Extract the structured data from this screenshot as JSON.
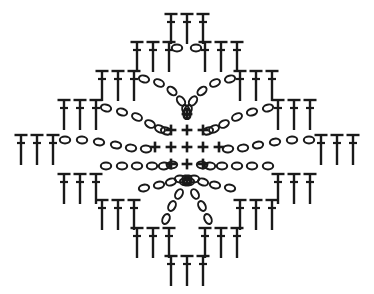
{
  "document": {
    "title": "Crochet Stitch Diagram",
    "kind": "crochet-pattern-chart",
    "background_color": "#ffffff",
    "ink_color": "#1a1a1a",
    "width": 374,
    "height": 294
  },
  "legend": {
    "symbols": [
      {
        "id": "dc",
        "glyph": "T",
        "name": "double-crochet-stitch",
        "description": "vertical stem with horizontal top bar and middle cross bar"
      },
      {
        "id": "ch",
        "glyph": "o",
        "name": "chain-stitch",
        "description": "small open oval"
      },
      {
        "id": "sc",
        "glyph": "+",
        "name": "single-crochet-stitch",
        "description": "plus / cross"
      }
    ]
  },
  "chart_data": {
    "type": "diagram",
    "symmetry": "8-way radial, mirrored horizontally and vertically",
    "center": {
      "x": 187,
      "y": 147
    },
    "counts": {
      "dc_total": 72,
      "ch_total": 78,
      "sc_total": 13
    },
    "sc_cluster": {
      "name": "center-single-crochet-cluster",
      "rows": [
        {
          "y": 114,
          "xs": [
            187
          ]
        },
        {
          "y": 130,
          "xs": [
            171,
            187,
            203
          ]
        },
        {
          "y": 147,
          "xs": [
            155,
            171,
            187,
            203,
            219
          ]
        },
        {
          "y": 164,
          "xs": [
            171,
            187,
            203
          ]
        },
        {
          "y": 180,
          "xs": [
            187
          ]
        }
      ]
    },
    "dc_groups": [
      {
        "name": "dc-top-center",
        "count": 3,
        "x": 187,
        "y": 14,
        "angle": 0,
        "spacing": 16
      },
      {
        "name": "dc-row2-left",
        "count": 3,
        "x": 153,
        "y": 42,
        "angle": 0,
        "spacing": 16
      },
      {
        "name": "dc-row2-right",
        "count": 3,
        "x": 221,
        "y": 42,
        "angle": 0,
        "spacing": 16
      },
      {
        "name": "dc-row3-left",
        "count": 3,
        "x": 118,
        "y": 71,
        "angle": 0,
        "spacing": 16
      },
      {
        "name": "dc-row3-right",
        "count": 3,
        "x": 256,
        "y": 71,
        "angle": 0,
        "spacing": 16
      },
      {
        "name": "dc-row4-left",
        "count": 3,
        "x": 80,
        "y": 100,
        "angle": 0,
        "spacing": 16
      },
      {
        "name": "dc-row4-right",
        "count": 3,
        "x": 294,
        "y": 100,
        "angle": 0,
        "spacing": 16
      },
      {
        "name": "dc-mid-left",
        "count": 3,
        "x": 37,
        "y": 135,
        "angle": 0,
        "spacing": 16
      },
      {
        "name": "dc-mid-right",
        "count": 3,
        "x": 337,
        "y": 135,
        "angle": 0,
        "spacing": 16
      },
      {
        "name": "dc-row6-left",
        "count": 3,
        "x": 80,
        "y": 174,
        "angle": 0,
        "spacing": 16
      },
      {
        "name": "dc-row6-right",
        "count": 3,
        "x": 294,
        "y": 174,
        "angle": 0,
        "spacing": 16
      },
      {
        "name": "dc-row7-left",
        "count": 3,
        "x": 118,
        "y": 200,
        "angle": 0,
        "spacing": 16
      },
      {
        "name": "dc-row7-right",
        "count": 3,
        "x": 256,
        "y": 200,
        "angle": 0,
        "spacing": 16
      },
      {
        "name": "dc-row8-left",
        "count": 3,
        "x": 153,
        "y": 228,
        "angle": 0,
        "spacing": 16
      },
      {
        "name": "dc-row8-right",
        "count": 3,
        "x": 221,
        "y": 228,
        "angle": 0,
        "spacing": 16
      },
      {
        "name": "dc-bottom-center",
        "count": 3,
        "x": 187,
        "y": 256,
        "angle": 0,
        "spacing": 16
      }
    ],
    "chain_arcs": [
      {
        "name": "ch-arc-top-center",
        "count": 2,
        "points": [
          [
            177,
            48
          ],
          [
            196,
            48
          ]
        ]
      },
      {
        "name": "ch-arc-upper-left",
        "count": 6,
        "points": [
          [
            144,
            79
          ],
          [
            159,
            83
          ],
          [
            172,
            91
          ],
          [
            181,
            101
          ],
          [
            186,
            110
          ],
          [
            187,
            114
          ]
        ]
      },
      {
        "name": "ch-arc-upper-right",
        "count": 6,
        "points": [
          [
            230,
            79
          ],
          [
            215,
            83
          ],
          [
            202,
            91
          ],
          [
            193,
            101
          ],
          [
            188,
            110
          ],
          [
            187,
            114
          ]
        ]
      },
      {
        "name": "ch-arc-left-upper-diag",
        "count": 6,
        "points": [
          [
            106,
            108
          ],
          [
            122,
            112
          ],
          [
            137,
            117
          ],
          [
            150,
            124
          ],
          [
            160,
            129
          ],
          [
            166,
            131
          ]
        ]
      },
      {
        "name": "ch-arc-right-upper-diag",
        "count": 6,
        "points": [
          [
            268,
            108
          ],
          [
            252,
            112
          ],
          [
            237,
            117
          ],
          [
            224,
            124
          ],
          [
            214,
            129
          ],
          [
            208,
            131
          ]
        ]
      },
      {
        "name": "ch-arc-left-middle",
        "count": 6,
        "points": [
          [
            65,
            140
          ],
          [
            82,
            140
          ],
          [
            99,
            142
          ],
          [
            116,
            145
          ],
          [
            131,
            148
          ],
          [
            146,
            149
          ]
        ]
      },
      {
        "name": "ch-arc-right-middle",
        "count": 6,
        "points": [
          [
            309,
            140
          ],
          [
            292,
            140
          ],
          [
            275,
            142
          ],
          [
            258,
            145
          ],
          [
            243,
            148
          ],
          [
            228,
            149
          ]
        ]
      },
      {
        "name": "ch-arc-left-lower-diag",
        "count": 6,
        "points": [
          [
            106,
            166
          ],
          [
            122,
            166
          ],
          [
            137,
            166
          ],
          [
            152,
            166
          ],
          [
            164,
            166
          ],
          [
            172,
            165
          ]
        ]
      },
      {
        "name": "ch-arc-right-lower-diag",
        "count": 6,
        "points": [
          [
            268,
            166
          ],
          [
            252,
            166
          ],
          [
            237,
            166
          ],
          [
            222,
            166
          ],
          [
            210,
            166
          ],
          [
            202,
            165
          ]
        ]
      },
      {
        "name": "ch-arc-lower-left",
        "count": 6,
        "points": [
          [
            144,
            188
          ],
          [
            159,
            185
          ],
          [
            171,
            182
          ],
          [
            180,
            179
          ],
          [
            185,
            182
          ],
          [
            187,
            180
          ]
        ]
      },
      {
        "name": "ch-arc-lower-right",
        "count": 6,
        "points": [
          [
            230,
            188
          ],
          [
            215,
            185
          ],
          [
            203,
            182
          ],
          [
            194,
            179
          ],
          [
            189,
            182
          ],
          [
            187,
            180
          ]
        ]
      },
      {
        "name": "ch-arc-bottom-left-tail",
        "count": 3,
        "points": [
          [
            179,
            194
          ],
          [
            172,
            206
          ],
          [
            166,
            219
          ]
        ]
      },
      {
        "name": "ch-arc-bottom-right-tail",
        "count": 3,
        "points": [
          [
            195,
            194
          ],
          [
            202,
            206
          ],
          [
            208,
            219
          ]
        ]
      }
    ]
  }
}
